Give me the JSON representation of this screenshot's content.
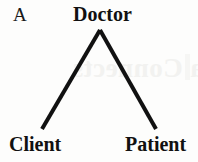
{
  "figure": {
    "panel_letter": "A",
    "type": "tree-diagram",
    "nodes": [
      {
        "id": "doctor",
        "label": "Doctor",
        "role": "root",
        "x": 100,
        "y": 14
      },
      {
        "id": "client",
        "label": "Client",
        "role": "leaf",
        "x": 36,
        "y": 144
      },
      {
        "id": "patient",
        "label": "Patient",
        "role": "leaf",
        "x": 157,
        "y": 144
      }
    ],
    "edges": [
      {
        "from": "doctor",
        "to": "client",
        "x1": 100,
        "y1": 30,
        "x2": 42,
        "y2": 129
      },
      {
        "from": "doctor",
        "to": "patient",
        "x1": 100,
        "y1": 30,
        "x2": 156,
        "y2": 129
      }
    ],
    "stroke_color": "#111111",
    "stroke_width": 4,
    "background_color": "#fdfdfc",
    "text_color": "#111111",
    "bleed_through_text": "a Connects",
    "bleed_through_color": "#f2f2f0"
  }
}
